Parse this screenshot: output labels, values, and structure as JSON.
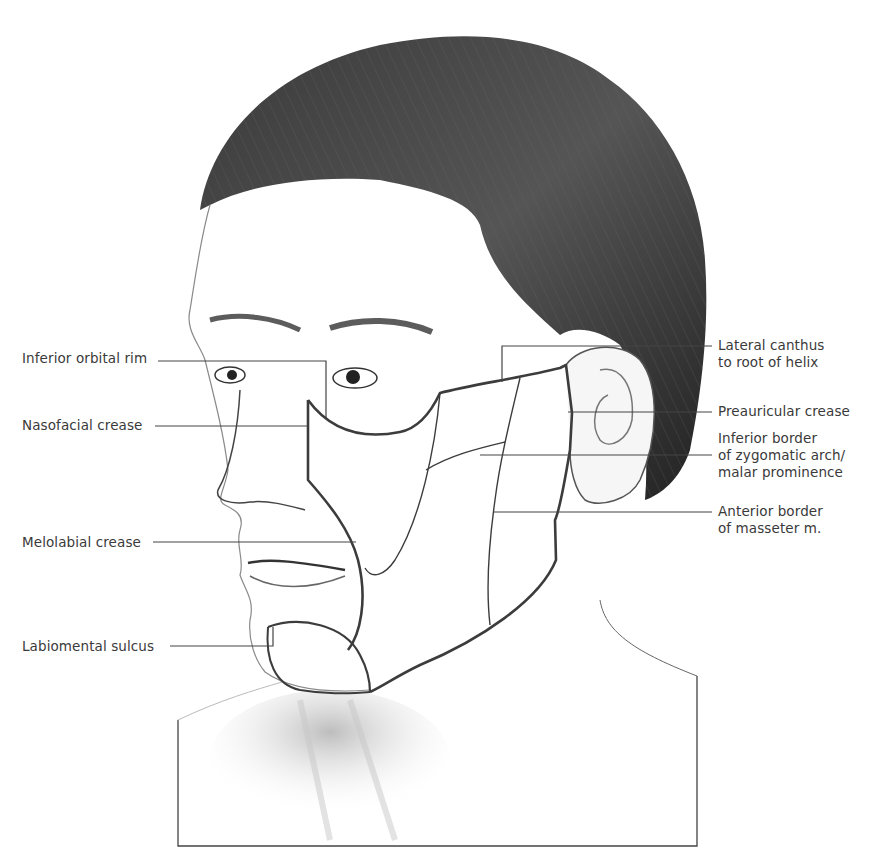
{
  "figure": {
    "colors": {
      "background": "#ffffff",
      "outline": "#3c3c3c",
      "leader_line": "#444444",
      "label_text": "#3a3a3a",
      "hair": "#2e2e2e",
      "shading": "#9a9a9a"
    }
  },
  "labels": {
    "left": [
      {
        "id": "inferior-orbital-rim",
        "text": "Inferior orbital rim"
      },
      {
        "id": "nasofacial-crease",
        "text": "Nasofacial crease"
      },
      {
        "id": "melolabial-crease",
        "text": "Melolabial crease"
      },
      {
        "id": "labiomental-sulcus",
        "text": "Labiomental sulcus"
      }
    ],
    "right": [
      {
        "id": "lateral-canthus",
        "lines": [
          "Lateral canthus",
          "to root of helix"
        ]
      },
      {
        "id": "preauricular-crease",
        "lines": [
          "Preauricular crease"
        ]
      },
      {
        "id": "inferior-border-zygomatic",
        "lines": [
          "Inferior border",
          "of zygomatic arch/",
          "malar prominence"
        ]
      },
      {
        "id": "anterior-border-masseter",
        "lines": [
          "Anterior border",
          "of masseter m."
        ]
      }
    ]
  }
}
